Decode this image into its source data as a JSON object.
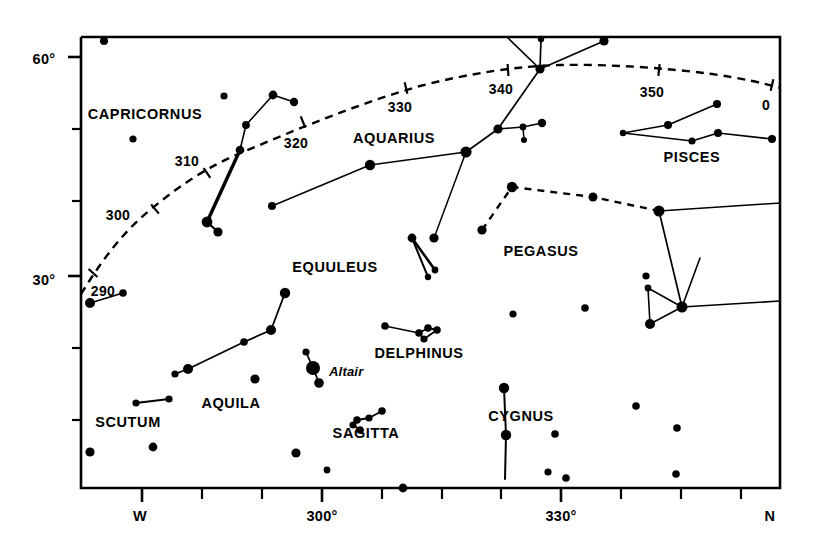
{
  "chart_data": {
    "type": "scatter",
    "title": "",
    "subtitle": "",
    "xlabel": "",
    "ylabel": "",
    "grid": false,
    "legend": null,
    "axes": {
      "x": {
        "label": "",
        "unit": "degrees azimuth",
        "range": [
          283,
          363
        ],
        "major_ticks": [
          {
            "value": 270,
            "text": "W"
          },
          {
            "value": 300,
            "text": "300°"
          },
          {
            "value": 330,
            "text": "330°"
          },
          {
            "value": 360,
            "text": "N"
          }
        ],
        "minor_tick_count": 13
      },
      "y": {
        "label": "",
        "unit": "degrees altitude",
        "range": [
          0,
          65
        ],
        "major_ticks": [
          {
            "value": 30,
            "text": "30°"
          },
          {
            "value": 60,
            "text": "60°"
          }
        ],
        "minor_ticks": [
          10,
          20,
          40,
          50
        ]
      }
    },
    "ecliptic": {
      "style": "dashed",
      "markers": [
        {
          "text": "290"
        },
        {
          "text": "300"
        },
        {
          "text": "310"
        },
        {
          "text": "320"
        },
        {
          "text": "330"
        },
        {
          "text": "340"
        },
        {
          "text": "350"
        },
        {
          "text": "0"
        }
      ]
    },
    "constellations": [
      {
        "name": "CAPRICORNUS"
      },
      {
        "name": "AQUARIUS"
      },
      {
        "name": "PISCES"
      },
      {
        "name": "PEGASUS"
      },
      {
        "name": "EQUULEUS"
      },
      {
        "name": "DELPHINUS"
      },
      {
        "name": "AQUILA"
      },
      {
        "name": "SCUTUM"
      },
      {
        "name": "SAGITTA"
      },
      {
        "name": "CYGNUS"
      }
    ],
    "named_stars": [
      {
        "name": "Altair"
      }
    ]
  },
  "frame": {
    "left": 81,
    "top": 37,
    "right": 780,
    "bottom": 488,
    "color": "#000000",
    "line_width": 2.6
  },
  "axis_labels": {
    "y": [
      {
        "text": "60°",
        "x": 44,
        "y": 52
      },
      {
        "text": "30°",
        "x": 44,
        "y": 273
      }
    ],
    "x": [
      {
        "text": "W",
        "x": 140,
        "y": 509
      },
      {
        "text": "300°",
        "x": 322,
        "y": 509
      },
      {
        "text": "330°",
        "x": 561,
        "y": 509
      },
      {
        "text": "N",
        "x": 770,
        "y": 509
      }
    ]
  },
  "y_ticks": [
    {
      "v": 60,
      "y": 57,
      "major": true
    },
    {
      "v": 50,
      "y": 129,
      "major": false
    },
    {
      "v": 40,
      "y": 201,
      "major": false
    },
    {
      "v": 30,
      "y": 276,
      "major": true
    },
    {
      "v": 20,
      "y": 348,
      "major": false
    },
    {
      "v": 10,
      "y": 420,
      "major": false
    }
  ],
  "x_ticks": [
    {
      "x": 142,
      "major": true
    },
    {
      "x": 202,
      "major": false
    },
    {
      "x": 262,
      "major": false
    },
    {
      "x": 322,
      "major": true
    },
    {
      "x": 382,
      "major": false
    },
    {
      "x": 442,
      "major": false
    },
    {
      "x": 501,
      "major": false
    },
    {
      "x": 561,
      "major": true
    },
    {
      "x": 621,
      "major": false
    },
    {
      "x": 681,
      "major": false
    },
    {
      "x": 741,
      "major": false
    }
  ],
  "ecliptic_path": "M 81,294 C 96,270 118,236 150,210 C 185,181 212,165 243,152 C 300,128 360,103 420,86 C 470,73 520,66 560,65 C 610,64 665,68 712,74 C 740,78 764,83 780,88",
  "ecliptic_ticks": [
    {
      "x": 93,
      "y": 273,
      "a": -48
    },
    {
      "x": 155,
      "y": 209,
      "a": -40
    },
    {
      "x": 207,
      "y": 173,
      "a": -34
    },
    {
      "x": 303,
      "y": 122,
      "a": -22
    },
    {
      "x": 406,
      "y": 88,
      "a": -13
    },
    {
      "x": 508,
      "y": 70,
      "a": -4
    },
    {
      "x": 659,
      "y": 70,
      "a": 6
    },
    {
      "x": 772,
      "y": 85,
      "a": 13
    }
  ],
  "ecliptic_labels": [
    {
      "text": "290",
      "x": 103,
      "y": 284
    },
    {
      "text": "300",
      "x": 118,
      "y": 208
    },
    {
      "text": "310",
      "x": 187,
      "y": 154
    },
    {
      "text": "320",
      "x": 296,
      "y": 136
    },
    {
      "text": "330",
      "x": 400,
      "y": 100
    },
    {
      "text": "340",
      "x": 501,
      "y": 82
    },
    {
      "text": "350",
      "x": 652,
      "y": 85
    },
    {
      "text": "0",
      "x": 766,
      "y": 98
    }
  ],
  "constellation_labels": [
    {
      "text": "CAPRICORNUS",
      "x": 145,
      "y": 107
    },
    {
      "text": "AQUARIUS",
      "x": 394,
      "y": 131
    },
    {
      "text": "PISCES",
      "x": 692,
      "y": 150
    },
    {
      "text": "PEGASUS",
      "x": 541,
      "y": 244
    },
    {
      "text": "EQUULEUS",
      "x": 335,
      "y": 260
    },
    {
      "text": "DELPHINUS",
      "x": 419,
      "y": 346
    },
    {
      "text": "AQUILA",
      "x": 231,
      "y": 396
    },
    {
      "text": "SCUTUM",
      "x": 128,
      "y": 415
    },
    {
      "text": "SAGITTA",
      "x": 366,
      "y": 426
    },
    {
      "text": "CYGNUS",
      "x": 521,
      "y": 409
    }
  ],
  "star_labels": [
    {
      "text": "Altair",
      "x": 329,
      "y": 365
    }
  ],
  "stars": [
    {
      "x": 104,
      "y": 41,
      "r": 4.0
    },
    {
      "x": 224,
      "y": 96,
      "r": 3.6
    },
    {
      "x": 133,
      "y": 139,
      "r": 3.6
    },
    {
      "x": 294,
      "y": 102,
      "r": 4.2
    },
    {
      "x": 273,
      "y": 95,
      "r": 4.4
    },
    {
      "x": 246,
      "y": 125,
      "r": 3.9
    },
    {
      "x": 240,
      "y": 150,
      "r": 4.3
    },
    {
      "x": 207,
      "y": 222,
      "r": 5.4
    },
    {
      "x": 218,
      "y": 232,
      "r": 4.6
    },
    {
      "x": 272,
      "y": 206,
      "r": 4.0
    },
    {
      "x": 370,
      "y": 165,
      "r": 5.2
    },
    {
      "x": 466,
      "y": 152,
      "r": 5.6
    },
    {
      "x": 498,
      "y": 129,
      "r": 4.6
    },
    {
      "x": 523,
      "y": 127,
      "r": 3.4
    },
    {
      "x": 524,
      "y": 140,
      "r": 3.0
    },
    {
      "x": 542,
      "y": 123,
      "r": 4.2
    },
    {
      "x": 541,
      "y": 39,
      "r": 3.2
    },
    {
      "x": 540,
      "y": 69,
      "r": 4.6
    },
    {
      "x": 604,
      "y": 41,
      "r": 4.6
    },
    {
      "x": 623,
      "y": 133,
      "r": 3.2
    },
    {
      "x": 668,
      "y": 125,
      "r": 4.0
    },
    {
      "x": 717,
      "y": 104,
      "r": 4.0
    },
    {
      "x": 692,
      "y": 141,
      "r": 3.6
    },
    {
      "x": 718,
      "y": 133,
      "r": 4.0
    },
    {
      "x": 772,
      "y": 139,
      "r": 4.0
    },
    {
      "x": 434,
      "y": 238,
      "r": 4.6
    },
    {
      "x": 512,
      "y": 187,
      "r": 5.2
    },
    {
      "x": 593,
      "y": 197,
      "r": 4.5
    },
    {
      "x": 482,
      "y": 230,
      "r": 4.6
    },
    {
      "x": 659,
      "y": 211,
      "r": 5.5
    },
    {
      "x": 646,
      "y": 276,
      "r": 3.6
    },
    {
      "x": 648,
      "y": 288,
      "r": 3.4
    },
    {
      "x": 682,
      "y": 307,
      "r": 5.5
    },
    {
      "x": 650,
      "y": 324,
      "r": 5.0
    },
    {
      "x": 412,
      "y": 238,
      "r": 4.4
    },
    {
      "x": 435,
      "y": 270,
      "r": 3.4
    },
    {
      "x": 428,
      "y": 277,
      "r": 3.2
    },
    {
      "x": 385,
      "y": 326,
      "r": 3.8
    },
    {
      "x": 419,
      "y": 333,
      "r": 3.8
    },
    {
      "x": 428,
      "y": 328,
      "r": 3.8
    },
    {
      "x": 424,
      "y": 339,
      "r": 3.6
    },
    {
      "x": 437,
      "y": 330,
      "r": 3.8
    },
    {
      "x": 513,
      "y": 314,
      "r": 3.6
    },
    {
      "x": 90,
      "y": 303,
      "r": 5.0
    },
    {
      "x": 123,
      "y": 293,
      "r": 3.8
    },
    {
      "x": 285,
      "y": 293,
      "r": 5.2
    },
    {
      "x": 271,
      "y": 330,
      "r": 5.0
    },
    {
      "x": 244,
      "y": 342,
      "r": 3.8
    },
    {
      "x": 188,
      "y": 369,
      "r": 5.0
    },
    {
      "x": 175,
      "y": 374,
      "r": 3.6
    },
    {
      "x": 306,
      "y": 352,
      "r": 3.6
    },
    {
      "x": 313,
      "y": 368,
      "r": 7.0
    },
    {
      "x": 319,
      "y": 383,
      "r": 4.8
    },
    {
      "x": 255,
      "y": 379,
      "r": 4.6
    },
    {
      "x": 136,
      "y": 403,
      "r": 3.6
    },
    {
      "x": 169,
      "y": 399,
      "r": 3.6
    },
    {
      "x": 360,
      "y": 430,
      "r": 3.8
    },
    {
      "x": 353,
      "y": 425,
      "r": 3.6
    },
    {
      "x": 357,
      "y": 420,
      "r": 3.8
    },
    {
      "x": 369,
      "y": 418,
      "r": 3.6
    },
    {
      "x": 382,
      "y": 411,
      "r": 3.8
    },
    {
      "x": 90,
      "y": 452,
      "r": 4.6
    },
    {
      "x": 153,
      "y": 447,
      "r": 4.4
    },
    {
      "x": 296,
      "y": 453,
      "r": 4.6
    },
    {
      "x": 327,
      "y": 470,
      "r": 3.4
    },
    {
      "x": 403,
      "y": 488,
      "r": 4.4
    },
    {
      "x": 504,
      "y": 388,
      "r": 5.2
    },
    {
      "x": 506,
      "y": 435,
      "r": 5.2
    },
    {
      "x": 555,
      "y": 434,
      "r": 3.8
    },
    {
      "x": 548,
      "y": 472,
      "r": 3.6
    },
    {
      "x": 566,
      "y": 478,
      "r": 3.8
    },
    {
      "x": 585,
      "y": 308,
      "r": 3.8
    },
    {
      "x": 636,
      "y": 406,
      "r": 3.8
    },
    {
      "x": 677,
      "y": 428,
      "r": 3.8
    },
    {
      "x": 676,
      "y": 474,
      "r": 3.8
    }
  ],
  "solid_lines": [
    {
      "pts": [
        [
          240,
          150
        ],
        [
          246,
          125
        ],
        [
          273,
          95
        ],
        [
          294,
          102
        ]
      ],
      "w": 1.6
    },
    {
      "pts": [
        [
          240,
          150
        ],
        [
          207,
          222
        ]
      ],
      "w": 3.4
    },
    {
      "pts": [
        [
          207,
          222
        ],
        [
          218,
          232
        ]
      ],
      "w": 2.2
    },
    {
      "pts": [
        [
          272,
          206
        ],
        [
          370,
          165
        ],
        [
          466,
          152
        ]
      ],
      "w": 1.5
    },
    {
      "pts": [
        [
          466,
          152
        ],
        [
          498,
          129
        ],
        [
          540,
          69
        ],
        [
          541,
          39
        ]
      ],
      "w": 1.7
    },
    {
      "pts": [
        [
          540,
          69
        ],
        [
          604,
          41
        ]
      ],
      "w": 1.7
    },
    {
      "pts": [
        [
          540,
          69
        ],
        [
          508,
          38
        ]
      ],
      "w": 1.7
    },
    {
      "pts": [
        [
          498,
          129
        ],
        [
          523,
          127
        ]
      ],
      "w": 1.5
    },
    {
      "pts": [
        [
          523,
          127
        ],
        [
          524,
          140
        ]
      ],
      "w": 1.5
    },
    {
      "pts": [
        [
          523,
          127
        ],
        [
          542,
          123
        ]
      ],
      "w": 1.5
    },
    {
      "pts": [
        [
          623,
          133
        ],
        [
          668,
          125
        ],
        [
          717,
          104
        ]
      ],
      "w": 1.7
    },
    {
      "pts": [
        [
          623,
          133
        ],
        [
          692,
          141
        ],
        [
          718,
          133
        ],
        [
          772,
          139
        ]
      ],
      "w": 1.7
    },
    {
      "pts": [
        [
          659,
          211
        ],
        [
          780,
          203
        ]
      ],
      "w": 1.6
    },
    {
      "pts": [
        [
          659,
          211
        ],
        [
          682,
          307
        ]
      ],
      "w": 1.7
    },
    {
      "pts": [
        [
          682,
          307
        ],
        [
          780,
          301
        ]
      ],
      "w": 1.6
    },
    {
      "pts": [
        [
          682,
          307
        ],
        [
          648,
          288
        ]
      ],
      "w": 1.6
    },
    {
      "pts": [
        [
          682,
          307
        ],
        [
          650,
          324
        ]
      ],
      "w": 1.6
    },
    {
      "pts": [
        [
          650,
          324
        ],
        [
          648,
          288
        ]
      ],
      "w": 1.6
    },
    {
      "pts": [
        [
          682,
          307
        ],
        [
          700,
          258
        ]
      ],
      "w": 1.6
    },
    {
      "pts": [
        [
          412,
          238
        ],
        [
          435,
          270
        ]
      ],
      "w": 2.6
    },
    {
      "pts": [
        [
          412,
          238
        ],
        [
          428,
          277
        ]
      ],
      "w": 2.0
    },
    {
      "pts": [
        [
          385,
          326
        ],
        [
          419,
          333
        ]
      ],
      "w": 1.5
    },
    {
      "pts": [
        [
          419,
          333
        ],
        [
          424,
          339
        ]
      ],
      "w": 1.8
    },
    {
      "pts": [
        [
          419,
          333
        ],
        [
          428,
          328
        ]
      ],
      "w": 1.8
    },
    {
      "pts": [
        [
          428,
          328
        ],
        [
          437,
          330
        ]
      ],
      "w": 1.8
    },
    {
      "pts": [
        [
          424,
          339
        ],
        [
          437,
          330
        ]
      ],
      "w": 1.8
    },
    {
      "pts": [
        [
          90,
          303
        ],
        [
          123,
          293
        ]
      ],
      "w": 1.8
    },
    {
      "pts": [
        [
          188,
          369
        ],
        [
          244,
          342
        ],
        [
          271,
          330
        ],
        [
          285,
          293
        ]
      ],
      "w": 1.8
    },
    {
      "pts": [
        [
          188,
          369
        ],
        [
          175,
          374
        ]
      ],
      "w": 1.8
    },
    {
      "pts": [
        [
          136,
          403
        ],
        [
          169,
          399
        ]
      ],
      "w": 2.2
    },
    {
      "pts": [
        [
          306,
          352
        ],
        [
          313,
          368
        ]
      ],
      "w": 1.8
    },
    {
      "pts": [
        [
          313,
          368
        ],
        [
          319,
          383
        ]
      ],
      "w": 1.8
    },
    {
      "pts": [
        [
          353,
          425
        ],
        [
          360,
          430
        ]
      ],
      "w": 1.8
    },
    {
      "pts": [
        [
          353,
          425
        ],
        [
          357,
          420
        ]
      ],
      "w": 1.8
    },
    {
      "pts": [
        [
          357,
          420
        ],
        [
          369,
          418
        ]
      ],
      "w": 1.8
    },
    {
      "pts": [
        [
          369,
          418
        ],
        [
          382,
          411
        ]
      ],
      "w": 1.8
    },
    {
      "pts": [
        [
          504,
          388
        ],
        [
          506,
          435
        ]
      ],
      "w": 2.0
    },
    {
      "pts": [
        [
          506,
          435
        ],
        [
          505,
          479
        ]
      ],
      "w": 2.0
    },
    {
      "pts": [
        [
          434,
          238
        ],
        [
          466,
          152
        ]
      ],
      "w": 1.5
    }
  ],
  "dashed_lines": [
    {
      "pts": [
        [
          482,
          230
        ],
        [
          512,
          187
        ],
        [
          593,
          197
        ],
        [
          659,
          211
        ]
      ],
      "w": 2.4
    }
  ]
}
